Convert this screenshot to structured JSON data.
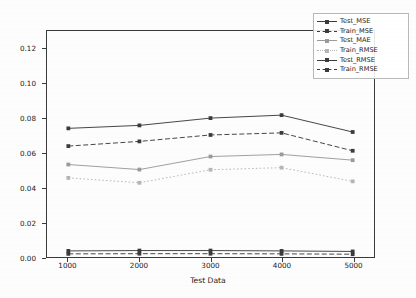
{
  "chart_data": {
    "type": "line",
    "title": "",
    "xlabel": "Test Data",
    "ylabel": "Performance",
    "x": [
      1000,
      2000,
      3000,
      4000,
      5000
    ],
    "xticklabels": [
      "1000",
      "2000",
      "3000",
      "4000",
      "5000"
    ],
    "yticklabels": [
      "0.00",
      "0.02",
      "0.04",
      "0.06",
      "0.08",
      "0.10",
      "0.12"
    ],
    "yticks": [
      0.0,
      0.02,
      0.04,
      0.06,
      0.08,
      0.1,
      0.12
    ],
    "xlim": [
      700,
      5300
    ],
    "ylim": [
      0.0,
      0.13
    ],
    "grid": false,
    "legend_position": "upper right",
    "series": [
      {
        "name": "Test_MSE",
        "values": [
          0.074,
          0.0757,
          0.0799,
          0.0816,
          0.0719
        ],
        "color": "#3b3b3b",
        "linestyle": "solid",
        "marker": "square"
      },
      {
        "name": "Train_MSE",
        "values": [
          0.0638,
          0.0665,
          0.0702,
          0.0714,
          0.0611
        ],
        "color": "#3b3b3b",
        "linestyle": "dashed",
        "marker": "square"
      },
      {
        "name": "Test_MAE",
        "values": [
          0.0532,
          0.0503,
          0.0578,
          0.059,
          0.0557
        ],
        "color": "#9a9a9a",
        "linestyle": "solid",
        "marker": "square"
      },
      {
        "name": "Train_RMSE",
        "values": [
          0.0455,
          0.0427,
          0.0502,
          0.0514,
          0.0435
        ],
        "color": "#b5b5b5",
        "linestyle": "dotted",
        "marker": "square"
      },
      {
        "name": "Test_RMSE",
        "values": [
          0.0035,
          0.0037,
          0.0037,
          0.0035,
          0.0032
        ],
        "color": "#3b3b3b",
        "linestyle": "solid",
        "marker": "square"
      },
      {
        "name": "Train_RMSE",
        "values": [
          0.0018,
          0.0019,
          0.0019,
          0.0018,
          0.0016
        ],
        "color": "#3b3b3b",
        "linestyle": "dashed",
        "marker": "square"
      }
    ]
  }
}
